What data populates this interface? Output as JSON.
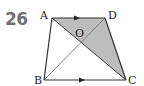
{
  "problem": {
    "number": "26"
  },
  "diagram": {
    "shape": "trapezoid",
    "points": {
      "A": {
        "label": "A",
        "x": 52,
        "y": 18
      },
      "D": {
        "label": "D",
        "x": 105,
        "y": 18
      },
      "B": {
        "label": "B",
        "x": 44,
        "y": 80
      },
      "C": {
        "label": "C",
        "x": 126,
        "y": 80
      },
      "O": {
        "label": "O",
        "x": 81,
        "y": 42
      }
    },
    "parallel_sides": [
      "AD",
      "BC"
    ],
    "diagonals": [
      "AC",
      "BD"
    ],
    "shaded_regions": [
      "AOD",
      "DOC"
    ],
    "colors": {
      "line": "#333333",
      "shade": "#bdbdbd",
      "number": "#707070"
    }
  }
}
